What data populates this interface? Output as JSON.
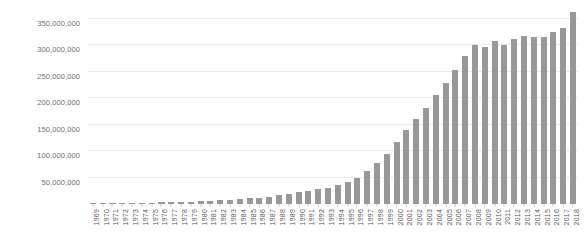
{
  "chart_data": {
    "type": "bar",
    "title": "",
    "xlabel": "",
    "ylabel": "",
    "ylim": [
      0,
      370000000
    ],
    "grid": true,
    "legend": false,
    "bar_color": "#989898",
    "gridline_color": "#e9e9e9",
    "ytick_labels": [
      "50,000,000",
      "100,000,000",
      "150,000,000",
      "200,000,000",
      "250,000,000",
      "300,000,000",
      "350,000,000"
    ],
    "yticks": [
      50000000,
      100000000,
      150000000,
      200000000,
      250000000,
      300000000,
      350000000
    ],
    "categories": [
      "1969",
      "1970",
      "1971",
      "1972",
      "1973",
      "1974",
      "1975",
      "1976",
      "1977",
      "1978",
      "1979",
      "1980",
      "1981",
      "1982",
      "1983",
      "1984",
      "1985",
      "1986",
      "1987",
      "1988",
      "1989",
      "1990",
      "1991",
      "1992",
      "1993",
      "1994",
      "1995",
      "1996",
      "1997",
      "1998",
      "1999",
      "2000",
      "2001",
      "2002",
      "2003",
      "2004",
      "2005",
      "2006",
      "2007",
      "2008",
      "2009",
      "2010",
      "2011",
      "2012",
      "2013",
      "2014",
      "2015",
      "2016",
      "2017",
      "2018"
    ],
    "values": [
      1000000,
      1200000,
      1400000,
      1600000,
      1900000,
      2200000,
      2500000,
      2900000,
      3300000,
      3800000,
      4300000,
      5000000,
      5800000,
      6700000,
      7800000,
      9000000,
      10500000,
      12000000,
      14000000,
      16500000,
      19000000,
      22000000,
      25000000,
      28000000,
      31000000,
      35000000,
      41000000,
      50000000,
      62000000,
      77000000,
      95000000,
      118000000,
      140000000,
      160000000,
      182000000,
      205000000,
      228000000,
      253000000,
      280000000,
      300000000,
      296000000,
      307000000,
      300000000,
      312000000,
      318000000,
      316000000,
      316000000,
      325000000,
      332000000,
      363000000
    ]
  }
}
